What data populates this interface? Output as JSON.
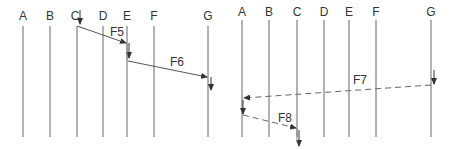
{
  "diagrams": [
    {
      "id": "left",
      "lifelines": [
        {
          "label": "A",
          "x": 23
        },
        {
          "label": "B",
          "x": 50
        },
        {
          "label": "C",
          "x": 77
        },
        {
          "label": "D",
          "x": 103
        },
        {
          "label": "E",
          "x": 128
        },
        {
          "label": "F",
          "x": 154
        },
        {
          "label": "G",
          "x": 208
        }
      ],
      "messages": [
        {
          "label": "F5",
          "from": "C",
          "to": "E",
          "style": "solid"
        },
        {
          "label": "F6",
          "from": "E",
          "to": "G",
          "style": "solid"
        }
      ]
    },
    {
      "id": "right",
      "lifelines": [
        {
          "label": "A",
          "x": 242
        },
        {
          "label": "B",
          "x": 269
        },
        {
          "label": "C",
          "x": 297
        },
        {
          "label": "D",
          "x": 324
        },
        {
          "label": "E",
          "x": 349
        },
        {
          "label": "F",
          "x": 376
        },
        {
          "label": "G",
          "x": 431
        }
      ],
      "messages": [
        {
          "label": "F7",
          "from": "G",
          "to": "A",
          "style": "dashed"
        },
        {
          "label": "F8",
          "from": "A",
          "to": "C",
          "style": "dashed"
        }
      ]
    }
  ],
  "colors": {
    "line": "#555555",
    "text": "#333333",
    "background": "#ffffff"
  }
}
